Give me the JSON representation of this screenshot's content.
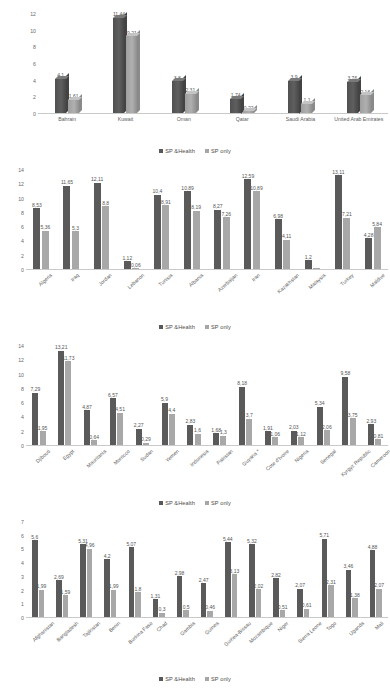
{
  "legend": {
    "series1": "SP &Health",
    "series2": "SP only",
    "color1": "#595959",
    "color2": "#a6a6a6"
  },
  "charts": [
    {
      "id": "chart-gcc",
      "legend_position": "none",
      "ylim": [
        0,
        12
      ],
      "yticks": [
        "0",
        "2",
        "4",
        "6",
        "8",
        "10",
        "12"
      ],
      "categories": [
        "Bahrain",
        "Kuwait",
        "Oman",
        "Qatar",
        "Saudi Arabia",
        "United Arab Emirates"
      ],
      "series": [
        {
          "name": "SP &Health",
          "values": [
            4.1,
            11.44,
            3.8,
            1.74,
            3.9,
            3.76
          ],
          "labels": [
            "4,1",
            "11,44",
            "3,8",
            "1,74",
            "3,9",
            "3,76"
          ]
        },
        {
          "name": "SP only",
          "values": [
            1.61,
            9.21,
            2.31,
            0.22,
            1.1,
            2.16
          ],
          "labels": [
            "1,61",
            "9,21",
            "2,31",
            "0,22",
            "1,1",
            "2,16"
          ]
        }
      ]
    },
    {
      "id": "chart-upper-middle",
      "legend_position": "top",
      "ylim": [
        0,
        14
      ],
      "yticks": [
        "0",
        "2",
        "4",
        "6",
        "8",
        "10",
        "12",
        "14"
      ],
      "categories": [
        "Algeria",
        "Iraq",
        "Jordan",
        "Lebanon",
        "Tunisia",
        "Albania",
        "Azerbaijan",
        "Iran",
        "Kazakhstan",
        "Malaysia",
        "Turkey",
        "Maldive"
      ],
      "series": [
        {
          "name": "SP &Health",
          "values": [
            8.53,
            11.65,
            12.11,
            1.12,
            10.4,
            10.89,
            8.27,
            12.59,
            6.98,
            1.2,
            13.11,
            4.28
          ],
          "labels": [
            "8,53",
            "11,65",
            "12,11",
            "1,12",
            "10,4",
            "10,89",
            "8,27",
            "12,59",
            "6,98",
            "1,2",
            "13,11",
            "4,28"
          ]
        },
        {
          "name": "SP only",
          "values": [
            5.36,
            5.3,
            8.8,
            0.06,
            8.91,
            8.19,
            7.26,
            10.89,
            4.11,
            0.05,
            7.21,
            5.84
          ],
          "labels": [
            "5,36",
            "5,3",
            "8,8",
            "0,06",
            "8,91",
            "8,19",
            "7,26",
            "10,89",
            "4,11",
            "",
            "7,21",
            "5,84"
          ]
        }
      ]
    },
    {
      "id": "chart-lower-middle",
      "legend_position": "top",
      "ylim": [
        0,
        14
      ],
      "yticks": [
        "0",
        "2",
        "4",
        "6",
        "8",
        "10",
        "12",
        "14"
      ],
      "categories": [
        "Djibouti",
        "Egypt",
        "Mauritania",
        "Morocco",
        "Sudan",
        "Yemen",
        "Indonesia",
        "Pakistan",
        "Guyana *",
        "Cote d'Ivoire",
        "Nigeria",
        "Senegal",
        "Kyrgyz Republic",
        "Cameroon"
      ],
      "series": [
        {
          "name": "SP &Health",
          "values": [
            7.29,
            13.21,
            4.87,
            6.57,
            2.27,
            5.9,
            2.83,
            1.68,
            8.18,
            1.91,
            2.03,
            5.34,
            9.58,
            2.93
          ],
          "labels": [
            "7,29",
            "13,21",
            "4,87",
            "6,57",
            "2,27",
            "5,9",
            "2,83",
            "1,68",
            "8,18",
            "1,91",
            "2,03",
            "5,34",
            "9,58",
            "2,93"
          ]
        },
        {
          "name": "SP only",
          "values": [
            1.95,
            11.73,
            0.64,
            4.51,
            0.29,
            4.4,
            1.6,
            1.3,
            3.7,
            1.06,
            1.12,
            2.06,
            3.75,
            0.81
          ],
          "labels": [
            "1,95",
            "11,73",
            "0,64",
            "4,51",
            "0,29",
            "4,4",
            "1,6",
            "1,3",
            "3,7",
            "1,06",
            "1,12",
            "2,06",
            "3,75",
            "0,81"
          ]
        }
      ]
    },
    {
      "id": "chart-low-income",
      "legend_position": "top",
      "ylim": [
        0,
        7
      ],
      "yticks": [
        "0",
        "1",
        "2",
        "3",
        "4",
        "5",
        "6",
        "7"
      ],
      "categories": [
        "Afghanistan",
        "Bangladesh",
        "Tajikistan",
        "Benin",
        "Burkina Faso",
        "Chad",
        "Gambia",
        "Guinea",
        "Guinea-Bissau",
        "Mozambique",
        "Niger",
        "Sierra Leone",
        "Togo",
        "Uganda",
        "Mali"
      ],
      "series": [
        {
          "name": "SP &Health",
          "values": [
            5.6,
            2.69,
            5.31,
            4.2,
            5.07,
            1.31,
            2.98,
            2.47,
            5.44,
            5.32,
            2.82,
            2.07,
            5.71,
            3.46,
            4.88
          ],
          "labels": [
            "5,6",
            "2,69",
            "5,31",
            "4,2",
            "5,07",
            "1,31",
            "2,98",
            "2,47",
            "5,44",
            "5,32",
            "2,82",
            "2,07",
            "5,71",
            "3,46",
            "4,88"
          ]
        },
        {
          "name": "SP only",
          "values": [
            1.99,
            1.59,
            4.96,
            1.99,
            1.8,
            0.3,
            0.5,
            0.46,
            3.13,
            2.02,
            0.51,
            0.61,
            2.31,
            1.38,
            2.07
          ],
          "labels": [
            "1,99",
            "1,59",
            "4,96",
            "1,99",
            "1,8",
            "0,3",
            "0,5",
            "0,46",
            "3,13",
            "2,02",
            "0,51",
            "0,61",
            "2,31",
            "1,38",
            "2,07"
          ]
        }
      ]
    }
  ],
  "chart_data": {
    "type": "bar",
    "xlabel": "",
    "ylabel": "",
    "legend": [
      "SP &Health",
      "SP only"
    ],
    "panels": [
      {
        "name": "GCC countries",
        "ylim": [
          0,
          12
        ],
        "categories": [
          "Bahrain",
          "Kuwait",
          "Oman",
          "Qatar",
          "Saudi Arabia",
          "United Arab Emirates"
        ],
        "series": [
          {
            "name": "SP &Health",
            "values": [
              4.1,
              11.44,
              3.8,
              1.74,
              3.9,
              3.76
            ]
          },
          {
            "name": "SP only",
            "values": [
              1.61,
              9.21,
              2.31,
              0.22,
              1.1,
              2.16
            ]
          }
        ]
      },
      {
        "name": "Upper middle income",
        "ylim": [
          0,
          14
        ],
        "categories": [
          "Algeria",
          "Iraq",
          "Jordan",
          "Lebanon",
          "Tunisia",
          "Albania",
          "Azerbaijan",
          "Iran",
          "Kazakhstan",
          "Malaysia",
          "Turkey",
          "Maldive"
        ],
        "series": [
          {
            "name": "SP &Health",
            "values": [
              8.53,
              11.65,
              12.11,
              1.12,
              10.4,
              10.89,
              8.27,
              12.59,
              6.98,
              1.2,
              13.11,
              4.28
            ]
          },
          {
            "name": "SP only",
            "values": [
              5.36,
              5.3,
              8.8,
              0.06,
              8.91,
              8.19,
              7.26,
              10.89,
              4.11,
              0.05,
              7.21,
              5.84
            ]
          }
        ]
      },
      {
        "name": "Lower middle income",
        "ylim": [
          0,
          14
        ],
        "categories": [
          "Djibouti",
          "Egypt",
          "Mauritania",
          "Morocco",
          "Sudan",
          "Yemen",
          "Indonesia",
          "Pakistan",
          "Guyana *",
          "Cote d'Ivoire",
          "Nigeria",
          "Senegal",
          "Kyrgyz Republic",
          "Cameroon"
        ],
        "series": [
          {
            "name": "SP &Health",
            "values": [
              7.29,
              13.21,
              4.87,
              6.57,
              2.27,
              5.9,
              2.83,
              1.68,
              8.18,
              1.91,
              2.03,
              5.34,
              9.58,
              2.93
            ]
          },
          {
            "name": "SP only",
            "values": [
              1.95,
              11.73,
              0.64,
              4.51,
              0.29,
              4.4,
              1.6,
              1.3,
              3.7,
              1.06,
              1.12,
              2.06,
              3.75,
              0.81
            ]
          }
        ]
      },
      {
        "name": "Low income",
        "ylim": [
          0,
          7
        ],
        "categories": [
          "Afghanistan",
          "Bangladesh",
          "Tajikistan",
          "Benin",
          "Burkina Faso",
          "Chad",
          "Gambia",
          "Guinea",
          "Guinea-Bissau",
          "Mozambique",
          "Niger",
          "Sierra Leone",
          "Togo",
          "Uganda",
          "Mali"
        ],
        "series": [
          {
            "name": "SP &Health",
            "values": [
              5.6,
              2.69,
              5.31,
              4.2,
              5.07,
              1.31,
              2.98,
              2.47,
              5.44,
              5.32,
              2.82,
              2.07,
              5.71,
              3.46,
              4.88
            ]
          },
          {
            "name": "SP only",
            "values": [
              1.99,
              1.59,
              4.96,
              1.99,
              1.8,
              0.3,
              0.5,
              0.46,
              3.13,
              2.02,
              0.51,
              0.61,
              2.31,
              1.38,
              2.07
            ]
          }
        ]
      }
    ]
  }
}
